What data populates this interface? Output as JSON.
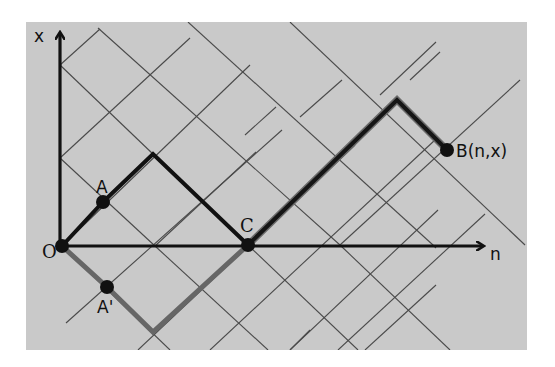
{
  "figure": {
    "type": "reflection-principle-lattice-path",
    "background_color": "#c9c9c9",
    "axes": {
      "horizontal": {
        "label": "n"
      },
      "vertical": {
        "label": "x"
      },
      "origin_label": "O"
    },
    "points": {
      "O": {
        "label": "O"
      },
      "A": {
        "label": "A"
      },
      "A_prime": {
        "label": "A'"
      },
      "C": {
        "label": "C"
      },
      "B": {
        "label": "B(n,x)"
      }
    },
    "paths": [
      {
        "name": "original-path-before-C",
        "color": "#111111",
        "description": "O → A → peak → C"
      },
      {
        "name": "reflected-path-before-C",
        "color": "#666666",
        "description": "O → A' → trough → C"
      },
      {
        "name": "common-path-after-C",
        "color": "#222222",
        "description": "C → peak → B"
      }
    ]
  }
}
